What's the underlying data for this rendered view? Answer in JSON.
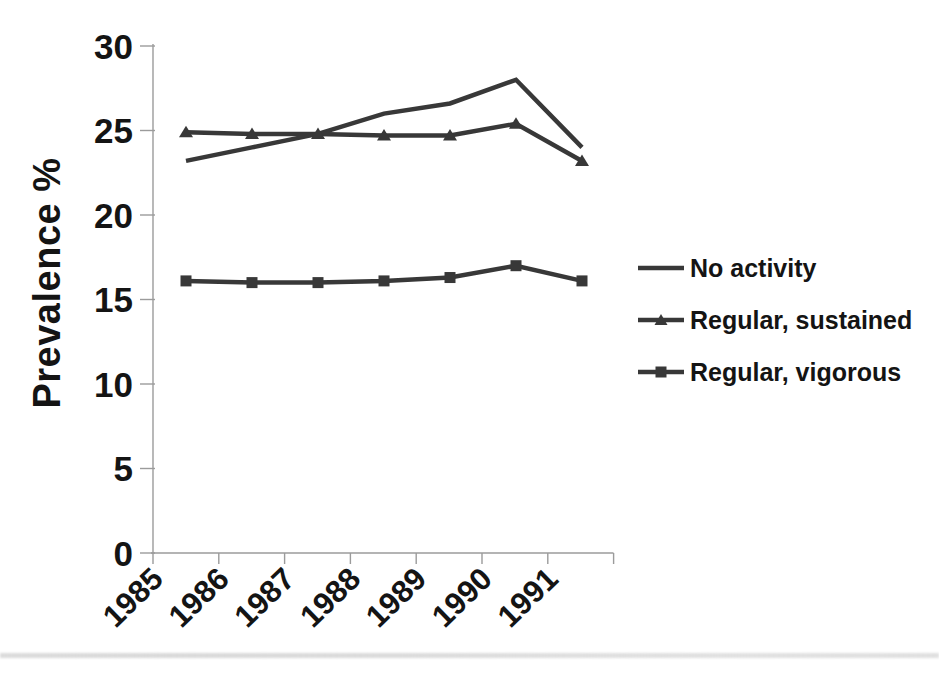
{
  "chart_data": {
    "type": "line",
    "title": "",
    "ylabel": "Prevalence %",
    "xlabel": "",
    "categories": [
      "1985",
      "1986",
      "1987",
      "1988",
      "1989",
      "1990",
      "1991"
    ],
    "yticks": [
      30,
      25,
      20,
      15,
      10,
      5,
      0
    ],
    "ylim": [
      0,
      30
    ],
    "grid": false,
    "legend_position": "right",
    "series": [
      {
        "name": "No activity",
        "marker": "none",
        "values": [
          23.2,
          24.0,
          24.8,
          26.0,
          26.6,
          28.0,
          24.0
        ]
      },
      {
        "name": "Regular, sustained",
        "marker": "triangle",
        "values": [
          24.9,
          24.8,
          24.8,
          24.7,
          24.7,
          25.4,
          23.2
        ]
      },
      {
        "name": "Regular, vigorous",
        "marker": "square",
        "values": [
          16.1,
          16.0,
          16.0,
          16.1,
          16.3,
          17.0,
          16.1
        ]
      }
    ],
    "colors": {
      "line": "#383838",
      "axis": "#9b9b9b",
      "text": "#141414",
      "background": "#ffffff",
      "scan_band": "#d9d9d9"
    }
  }
}
